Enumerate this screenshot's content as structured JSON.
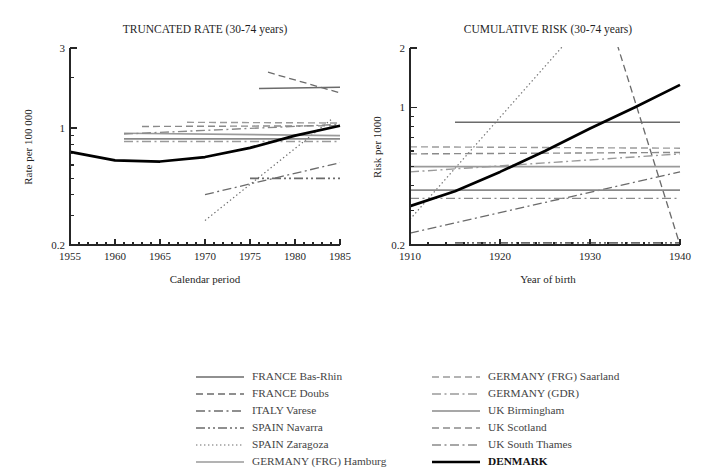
{
  "figure": {
    "width": 701,
    "height": 473,
    "background": "#ffffff"
  },
  "panels": [
    {
      "id": "truncated-rate",
      "title": "TRUNCATED RATE (30-74 years)",
      "xlabel": "Calendar period",
      "ylabel": "Rate per 100 000",
      "xticks": [
        1955,
        1960,
        1965,
        1970,
        1975,
        1980,
        1985
      ],
      "xlim": [
        1955,
        1985
      ],
      "ylim": [
        0.2,
        3
      ],
      "yticks_labeled": [
        0.2,
        1,
        3
      ],
      "yscale": "log",
      "minor_x_ticks": 5,
      "plot_box": {
        "x": 70,
        "y": 48,
        "w": 270,
        "h": 197
      }
    },
    {
      "id": "cumulative-risk",
      "title": "CUMULATIVE RISK (30-74 years)",
      "xlabel": "Year of birth",
      "ylabel": "Risk per 1000",
      "xticks": [
        1910,
        1920,
        1930,
        1940
      ],
      "xlim": [
        1910,
        1940
      ],
      "ylim": [
        0.2,
        2
      ],
      "yticks_labeled": [
        0.2,
        1,
        2
      ],
      "yscale": "log",
      "minor_x_ticks": 5,
      "plot_box": {
        "x": 410,
        "y": 48,
        "w": 270,
        "h": 197
      }
    }
  ],
  "chart_data": {
    "type": "line",
    "panels": [
      {
        "name": "TRUNCATED RATE (30-74 years)",
        "xlabel": "Calendar period",
        "ylabel": "Rate per 100 000",
        "xlim": [
          1955,
          1985
        ],
        "ylim": [
          0.2,
          3
        ],
        "yscale": "log",
        "xticks": [
          1955,
          1960,
          1965,
          1970,
          1975,
          1980,
          1985
        ],
        "ytick_labels": [
          "0.2",
          "1",
          "3"
        ],
        "grid": false,
        "series": [
          {
            "name": "FRANCE Bas-Rhin",
            "x": [
              1976,
              1985
            ],
            "y": [
              1.72,
              1.75
            ]
          },
          {
            "name": "FRANCE Doubs",
            "x": [
              1977,
              1985
            ],
            "y": [
              2.15,
              1.62
            ]
          },
          {
            "name": "ITALY Varese",
            "x": [
              1970,
              1985
            ],
            "y": [
              0.4,
              0.62
            ]
          },
          {
            "name": "SPAIN Navarra",
            "x": [
              1975,
              1985
            ],
            "y": [
              0.5,
              0.5
            ]
          },
          {
            "name": "SPAIN Zaragoza",
            "x": [
              1970,
              1984
            ],
            "y": [
              0.28,
              1.12
            ]
          },
          {
            "name": "GERMANY (FRG) Hamburg",
            "x": [
              1961,
              1985
            ],
            "y": [
              0.93,
              0.9
            ]
          },
          {
            "name": "GERMANY (FRG) Saarland",
            "x": [
              1968,
              1985
            ],
            "y": [
              1.08,
              1.07
            ]
          },
          {
            "name": "GERMANY (GDR)",
            "x": [
              1961,
              1985
            ],
            "y": [
              0.83,
              0.83
            ]
          },
          {
            "name": "UK Birmingham",
            "x": [
              1961,
              1985
            ],
            "y": [
              0.86,
              0.86
            ]
          },
          {
            "name": "UK Scotland",
            "x": [
              1963,
              1985
            ],
            "y": [
              1.02,
              1.03
            ]
          },
          {
            "name": "UK South Thames",
            "x": [
              1961,
              1985
            ],
            "y": [
              0.92,
              1.05
            ]
          },
          {
            "name": "DENMARK",
            "x": [
              1955,
              1960,
              1965,
              1970,
              1975,
              1980,
              1985
            ],
            "y": [
              0.72,
              0.64,
              0.63,
              0.67,
              0.76,
              0.9,
              1.03
            ]
          }
        ]
      },
      {
        "name": "CUMULATIVE RISK (30-74 years)",
        "xlabel": "Year of birth",
        "ylabel": "Risk per 1000",
        "xlim": [
          1910,
          1940
        ],
        "ylim": [
          0.2,
          2
        ],
        "yscale": "log",
        "xticks": [
          1910,
          1920,
          1930,
          1940
        ],
        "ytick_labels": [
          "0.2",
          "1",
          "2"
        ],
        "grid": false,
        "series": [
          {
            "name": "FRANCE Bas-Rhin",
            "x": [
              1915,
              1940
            ],
            "y": [
              0.84,
              0.84
            ]
          },
          {
            "name": "FRANCE Doubs",
            "x": [
              1933,
              1940
            ],
            "y": [
              2.1,
              0.2
            ]
          },
          {
            "name": "ITALY Varese",
            "x": [
              1910,
              1940
            ],
            "y": [
              0.23,
              0.47
            ]
          },
          {
            "name": "SPAIN Navarra",
            "x": [
              1915,
              1940
            ],
            "y": [
              0.205,
              0.205
            ]
          },
          {
            "name": "SPAIN Zaragoza",
            "x": [
              1910,
              1927
            ],
            "y": [
              0.27,
              2.05
            ]
          },
          {
            "name": "GERMANY (FRG) Hamburg",
            "x": [
              1910,
              1940
            ],
            "y": [
              0.5,
              0.5
            ]
          },
          {
            "name": "GERMANY (FRG) Saarland",
            "x": [
              1910,
              1940
            ],
            "y": [
              0.63,
              0.62
            ]
          },
          {
            "name": "GERMANY (GDR)",
            "x": [
              1910,
              1940
            ],
            "y": [
              0.47,
              0.58
            ]
          },
          {
            "name": "UK Birmingham",
            "x": [
              1910,
              1940
            ],
            "y": [
              0.38,
              0.38
            ]
          },
          {
            "name": "UK Scotland",
            "x": [
              1910,
              1940
            ],
            "y": [
              0.58,
              0.59
            ]
          },
          {
            "name": "UK South Thames",
            "x": [
              1910,
              1940
            ],
            "y": [
              0.345,
              0.345
            ]
          },
          {
            "name": "DENMARK",
            "x": [
              1910,
              1915,
              1920,
              1925,
              1930,
              1935,
              1940
            ],
            "y": [
              0.315,
              0.375,
              0.47,
              0.6,
              0.78,
              1.0,
              1.3
            ]
          }
        ]
      }
    ]
  },
  "legend": {
    "columns": [
      {
        "items": [
          {
            "label": "FRANCE Bas-Rhin",
            "dash": "solid",
            "color": "#6b6b6b",
            "width": 1.5,
            "bold": false
          },
          {
            "label": "FRANCE Doubs",
            "dash": "dashed",
            "color": "#6b6b6b",
            "width": 1.3,
            "bold": false
          },
          {
            "label": "ITALY Varese",
            "dash": "dashdot",
            "color": "#6b6b6b",
            "width": 1.3,
            "bold": false
          },
          {
            "label": "SPAIN Navarra",
            "dash": "dashdotdot",
            "color": "#6b6b6b",
            "width": 1.5,
            "bold": false
          },
          {
            "label": "SPAIN Zaragoza",
            "dash": "dotted",
            "color": "#6b6b6b",
            "width": 1.2,
            "bold": false
          },
          {
            "label": "GERMANY (FRG) Hamburg",
            "dash": "solid",
            "color": "#9a9a9a",
            "width": 1.5,
            "bold": false
          }
        ]
      },
      {
        "items": [
          {
            "label": "GERMANY (FRG) Saarland",
            "dash": "dashed",
            "color": "#9a9a9a",
            "width": 1.3,
            "bold": false
          },
          {
            "label": "GERMANY (GDR)",
            "dash": "dashdot",
            "color": "#9a9a9a",
            "width": 1.3,
            "bold": false
          },
          {
            "label": "UK Birmingham",
            "dash": "solid",
            "color": "#8a8a8a",
            "width": 1.5,
            "bold": false
          },
          {
            "label": "UK Scotland",
            "dash": "dashed",
            "color": "#8a8a8a",
            "width": 1.3,
            "bold": false
          },
          {
            "label": "UK South Thames",
            "dash": "dashdot",
            "color": "#8a8a8a",
            "width": 1.3,
            "bold": false
          },
          {
            "label": "DENMARK",
            "dash": "solid",
            "color": "#000000",
            "width": 2.6,
            "bold": true
          }
        ]
      }
    ],
    "layout": {
      "col1_x": 196,
      "col2_x": 432,
      "start_y": 377,
      "row_h": 17,
      "sample_w": 48,
      "text_gap": 8
    }
  },
  "series_styles": {
    "FRANCE Bas-Rhin": {
      "dash": "solid",
      "color": "#6b6b6b",
      "width": 1.5
    },
    "FRANCE Doubs": {
      "dash": "dashed",
      "color": "#6b6b6b",
      "width": 1.3
    },
    "ITALY Varese": {
      "dash": "dashdot",
      "color": "#6b6b6b",
      "width": 1.3
    },
    "SPAIN Navarra": {
      "dash": "dashdotdot",
      "color": "#6b6b6b",
      "width": 1.6
    },
    "SPAIN Zaragoza": {
      "dash": "dotted",
      "color": "#6b6b6b",
      "width": 1.2
    },
    "GERMANY (FRG) Hamburg": {
      "dash": "solid",
      "color": "#9a9a9a",
      "width": 1.6
    },
    "GERMANY (FRG) Saarland": {
      "dash": "dashed",
      "color": "#9a9a9a",
      "width": 1.4
    },
    "GERMANY (GDR)": {
      "dash": "dashdot",
      "color": "#9a9a9a",
      "width": 1.4
    },
    "UK Birmingham": {
      "dash": "solid",
      "color": "#8a8a8a",
      "width": 1.6
    },
    "UK Scotland": {
      "dash": "dashed",
      "color": "#8a8a8a",
      "width": 1.4
    },
    "UK South Thames": {
      "dash": "dashdot",
      "color": "#8a8a8a",
      "width": 1.4
    },
    "DENMARK": {
      "dash": "solid",
      "color": "#000000",
      "width": 2.7
    }
  },
  "dash_patterns": {
    "solid": "",
    "dashed": "7,4",
    "dashdot": "9,3.5,2,3.5",
    "dashdotdot": "9,3,2,3,2,3",
    "dotted": "1.4,2.6"
  }
}
